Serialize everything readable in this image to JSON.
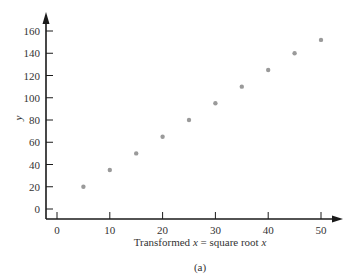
{
  "chart_data": {
    "type": "scatter",
    "title": "",
    "caption": "(a)",
    "xlabel": "Transformed x = square root x",
    "xlabel_parts": {
      "prefix": "Transformed ",
      "var1": "x",
      "middle": " = square root ",
      "var2": "x"
    },
    "ylabel": "y",
    "xlim": [
      -3,
      53
    ],
    "ylim": [
      -8,
      170
    ],
    "x_ticks": [
      0,
      10,
      20,
      30,
      40,
      50
    ],
    "y_ticks": [
      0,
      20,
      40,
      60,
      80,
      100,
      120,
      140,
      160
    ],
    "grid": false,
    "legend": null,
    "series": [
      {
        "name": "data",
        "color": "#9a9a9a",
        "x": [
          5,
          10,
          15,
          20,
          25,
          30,
          35,
          40,
          45,
          50
        ],
        "y": [
          20,
          35,
          50,
          65,
          80,
          95,
          110,
          125,
          140,
          152
        ]
      }
    ]
  },
  "colors": {
    "axis": "#1a1a1a",
    "point": "#9a9a9a"
  }
}
